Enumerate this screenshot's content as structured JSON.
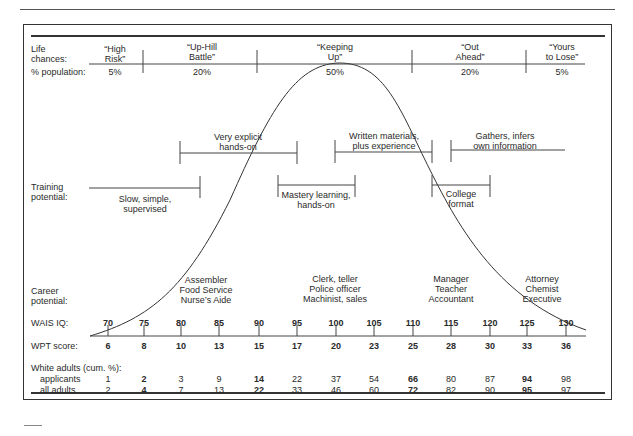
{
  "life_chances": {
    "label_line1": "Life",
    "label_line2": "chances:",
    "pop_label": "% population:",
    "groups": [
      {
        "line1": "“High",
        "line2": "Risk”",
        "pct": "5%"
      },
      {
        "line1": "“Up-Hill",
        "line2": "Battle”",
        "pct": "20%"
      },
      {
        "line1": "“Keeping",
        "line2": "Up”",
        "pct": "50%"
      },
      {
        "line1": "“Out",
        "line2": "Ahead”",
        "pct": "20%"
      },
      {
        "line1": "“Yours",
        "line2": "to Lose”",
        "pct": "5%"
      }
    ]
  },
  "training": {
    "label_line1": "Training",
    "label_line2": "potential:",
    "items": [
      {
        "line1": "Very explicit",
        "line2": "hands-on"
      },
      {
        "line1": "Written materials,",
        "line2": "plus experience"
      },
      {
        "line1": "Gathers, infers",
        "line2": "own information"
      },
      {
        "line1": "Slow, simple,",
        "line2": "supervised"
      },
      {
        "line1": "Mastery learning,",
        "line2": "hands-on"
      },
      {
        "line1": "College",
        "line2": "format"
      }
    ]
  },
  "career": {
    "label_line1": "Career",
    "label_line2": "potential:",
    "groups": [
      [
        "Assembler",
        "Food Service",
        "Nurse’s Aide"
      ],
      [
        "Clerk, teller",
        "Police officer",
        "Machinist, sales"
      ],
      [
        "Manager",
        "Teacher",
        "Accountant"
      ],
      [
        "Attorney",
        "Chemist",
        "Executive"
      ]
    ]
  },
  "scales": {
    "wais_label": "WAIS IQ:",
    "wpt_label": "WPT score:",
    "wais": [
      "70",
      "75",
      "80",
      "85",
      "90",
      "95",
      "100",
      "105",
      "110",
      "115",
      "120",
      "125",
      "130"
    ],
    "wpt": [
      "6",
      "8",
      "10",
      "13",
      "15",
      "17",
      "20",
      "23",
      "25",
      "28",
      "30",
      "33",
      "36"
    ]
  },
  "white_adults": {
    "title": "White adults (cum. %):",
    "applicants_label": "applicants",
    "all_label": "all adults",
    "applicants": [
      "1",
      "2",
      "3",
      "9",
      "14",
      "22",
      "37",
      "54",
      "66",
      "80",
      "87",
      "94",
      "98"
    ],
    "all_adults": [
      "2",
      "4",
      "7",
      "13",
      "22",
      "33",
      "46",
      "60",
      "72",
      "82",
      "90",
      "95",
      "97"
    ],
    "bold_indices": [
      1,
      4,
      8,
      11
    ]
  },
  "chart_data": {
    "type": "line",
    "title": "",
    "x": [
      70,
      75,
      80,
      85,
      90,
      95,
      100,
      105,
      110,
      115,
      120,
      125,
      130
    ],
    "x_secondary_wpt": [
      6,
      8,
      10,
      13,
      15,
      17,
      20,
      23,
      25,
      28,
      30,
      33,
      36
    ],
    "xlabel": "WAIS IQ",
    "xlabel_secondary": "WPT score",
    "population_bands": [
      {
        "name": "High Risk",
        "pct": 5
      },
      {
        "name": "Up-Hill Battle",
        "pct": 20
      },
      {
        "name": "Keeping Up",
        "pct": 50
      },
      {
        "name": "Out Ahead",
        "pct": 20
      },
      {
        "name": "Yours to Lose",
        "pct": 5
      }
    ],
    "series": [
      {
        "name": "White adults applicants (cum. %)",
        "values": [
          1,
          2,
          3,
          9,
          14,
          22,
          37,
          54,
          66,
          80,
          87,
          94,
          98
        ]
      },
      {
        "name": "White adults all adults (cum. %)",
        "values": [
          2,
          4,
          7,
          13,
          22,
          33,
          46,
          60,
          72,
          82,
          90,
          95,
          97
        ]
      }
    ],
    "curve": "bell curve centered at IQ 100",
    "grid": false,
    "legend": "none"
  }
}
